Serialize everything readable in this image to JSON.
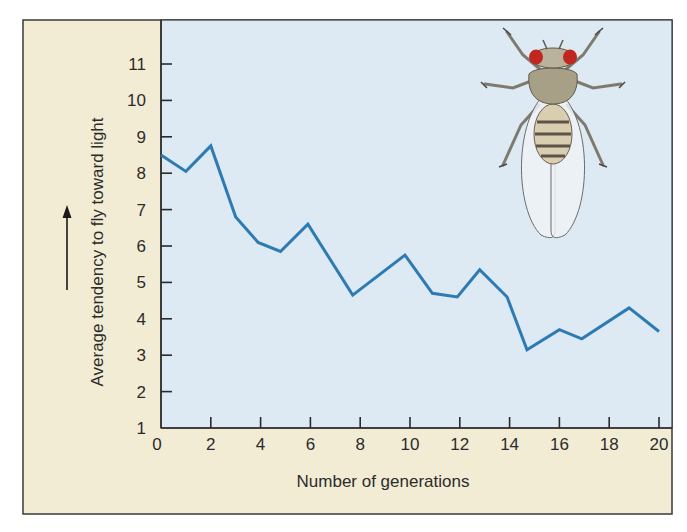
{
  "chart_data": {
    "type": "line",
    "title": "",
    "xlabel": "Number of generations",
    "ylabel": "Average tendency to fly toward light",
    "ylabel_arrow": "up",
    "xlim": [
      0,
      20
    ],
    "ylim": [
      1,
      11
    ],
    "x_ticks": [
      "0",
      "2",
      "4",
      "6",
      "8",
      "10",
      "12",
      "14",
      "16",
      "18",
      "20"
    ],
    "y_ticks": [
      "1",
      "2",
      "3",
      "4",
      "5",
      "6",
      "7",
      "8",
      "9",
      "10",
      "11"
    ],
    "grid": false,
    "legend": null,
    "illustration": "fruit-fly (Drosophila) drawing, top-right of plot",
    "series": [
      {
        "name": "Average tendency to fly toward light",
        "color": "#2e7bb4",
        "x": [
          0,
          1,
          2,
          3,
          3.9,
          4.8,
          5.9,
          7.7,
          9.8,
          10.9,
          11.9,
          12.8,
          13.9,
          14.7,
          16,
          16.9,
          18.8,
          20
        ],
        "y": [
          8.5,
          8.05,
          8.75,
          6.8,
          6.1,
          5.85,
          6.6,
          4.65,
          5.75,
          4.7,
          4.6,
          5.35,
          4.6,
          3.15,
          3.7,
          3.45,
          4.3,
          3.65
        ]
      }
    ]
  },
  "colors": {
    "frame_bg": "#f3ecd5",
    "plot_bg": "#dde9f3",
    "line": "#2e7bb4",
    "axis": "#2b2b2b"
  }
}
